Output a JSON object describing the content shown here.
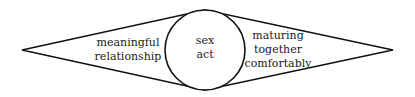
{
  "diagram": {
    "shape": {
      "outer": "diamond",
      "inner": "circle",
      "stroke_color": "#111111",
      "fill_color": "#ffffff"
    },
    "left_region": {
      "lines": [
        "meaningful",
        "relationship"
      ]
    },
    "center_region": {
      "lines": [
        "sex",
        "act"
      ]
    },
    "right_region": {
      "lines": [
        "maturing",
        "together",
        "comfortably"
      ]
    }
  }
}
